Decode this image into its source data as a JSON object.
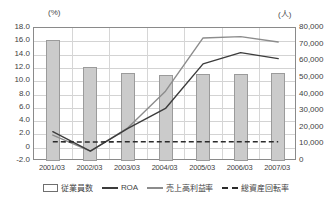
{
  "axes": {
    "left_unit": "(%)",
    "right_unit": "(人)",
    "left_ticks": [
      "18.0",
      "16.0",
      "14.0",
      "12.0",
      "10.0",
      "8.0",
      "6.0",
      "4.0",
      "2.0",
      "0",
      "-2.0"
    ],
    "right_ticks": [
      "80,000",
      "70,000",
      "60,000",
      "50,000",
      "40,000",
      "30,000",
      "20,000",
      "10,000",
      "0"
    ]
  },
  "legend": {
    "items": [
      {
        "label": "従業員数",
        "marker": "bar-swatch-icon"
      },
      {
        "label": "ROA",
        "marker": "solid-line-dark-icon"
      },
      {
        "label": "売上高利益率",
        "marker": "solid-line-gray-icon"
      },
      {
        "label": "総資産回転率",
        "marker": "dashed-line-icon"
      }
    ]
  },
  "chart_data": {
    "type": "bar",
    "title": "",
    "xlabel": "",
    "ylabel": "(%)",
    "y2label": "(人)",
    "categories": [
      "2001/03",
      "2002/03",
      "2003/03",
      "2004/03",
      "2005/03",
      "2006/03",
      "2007/03"
    ],
    "ylim": [
      -2.0,
      18.0
    ],
    "ytick_step": 2.0,
    "y2lim": [
      0,
      80000
    ],
    "y2tick_step": 10000,
    "grid": true,
    "legend_position": "bottom",
    "series": [
      {
        "name": "従業員数",
        "type": "bar",
        "axis": "right",
        "unit": "人",
        "values": [
          72500,
          56500,
          53000,
          52000,
          52200,
          52500,
          53000
        ]
      },
      {
        "name": "ROA",
        "type": "line",
        "axis": "left",
        "unit": "%",
        "values": [
          2.4,
          -0.5,
          2.9,
          5.9,
          12.6,
          14.3,
          13.4
        ]
      },
      {
        "name": "売上高利益率",
        "type": "line",
        "axis": "left",
        "unit": "%",
        "values": [
          1.9,
          -0.5,
          3.0,
          8.5,
          16.5,
          16.7,
          15.9
        ]
      },
      {
        "name": "総資産回転率",
        "type": "line",
        "axis": "left",
        "unit": "%",
        "values": [
          0.9,
          0.85,
          0.9,
          0.9,
          0.9,
          0.9,
          0.9
        ]
      }
    ]
  },
  "colors": {
    "bar_fill": "#cbcbcb",
    "bar_border": "#9b9b9b",
    "roa_line": "#3c3c3c",
    "margin_line": "#8c8c8c",
    "turnover_line": "#2b2b2b",
    "grid": "#d3d3d3",
    "axis": "#8a8a8a"
  }
}
